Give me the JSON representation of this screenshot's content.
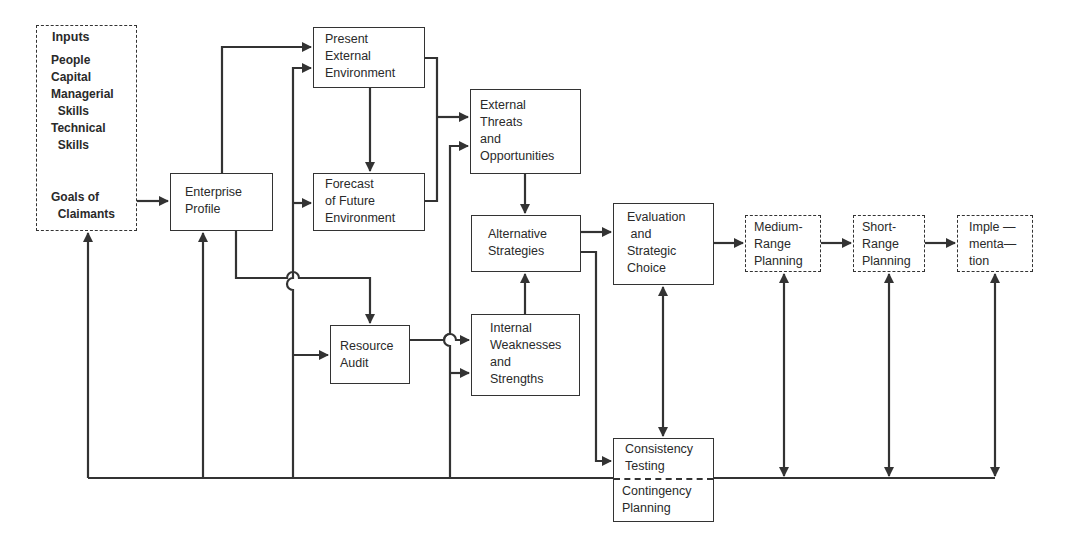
{
  "diagram": {
    "type": "flowchart",
    "nodes": {
      "inputs": {
        "heading": "Inputs",
        "items_text": "People\nCapital\nManagerial\n  Skills\nTechnical\n  Skills",
        "goals_text": "Goals of\n  Claimants",
        "style": "dashed"
      },
      "enterprise_profile": {
        "label": "Enterprise\nProfile",
        "style": "solid"
      },
      "present_external": {
        "label": "Present\nExternal\nEnvironment",
        "style": "solid"
      },
      "forecast_future": {
        "label": "Forecast\nof Future\nEnvironment",
        "style": "solid"
      },
      "resource_audit": {
        "label": "Resource\nAudit",
        "style": "solid"
      },
      "external_threats": {
        "label": "External\nThreats\nand\nOpportunities",
        "style": "solid"
      },
      "alternative_strategies": {
        "label": "Alternative\nStrategies",
        "style": "solid"
      },
      "internal_weaknesses": {
        "label": "Internal\nWeaknesses\nand\nStrengths",
        "style": "solid"
      },
      "evaluation": {
        "label": "Evaluation\n and\nStrategic\nChoice",
        "style": "solid"
      },
      "consistency": {
        "label_top": "Consistency\nTesting",
        "label_bottom": "Contingency\nPlanning",
        "style": "solid-with-dashed-divider"
      },
      "medium_range": {
        "label": "Medium-\nRange\nPlanning",
        "style": "dashed"
      },
      "short_range": {
        "label": "Short-\nRange\nPlanning",
        "style": "dashed"
      },
      "implementation": {
        "label": "Imple —\nmenta—\ntion",
        "style": "dashed"
      }
    },
    "edges": [
      {
        "from": "inputs",
        "to": "enterprise_profile"
      },
      {
        "from": "enterprise_profile",
        "to": "present_external"
      },
      {
        "from": "enterprise_profile",
        "to": "resource_audit"
      },
      {
        "from": "feedback_line",
        "to": "present_external"
      },
      {
        "from": "feedback_line",
        "to": "forecast_future"
      },
      {
        "from": "feedback_line",
        "to": "resource_audit"
      },
      {
        "from": "present_external",
        "to": "forecast_future"
      },
      {
        "from": "present_external",
        "to": "external_threats"
      },
      {
        "from": "forecast_future",
        "to": "external_threats"
      },
      {
        "from": "feedback_line",
        "to": "external_threats"
      },
      {
        "from": "resource_audit",
        "to": "internal_weaknesses"
      },
      {
        "from": "feedback_line",
        "to": "internal_weaknesses"
      },
      {
        "from": "external_threats",
        "to": "alternative_strategies"
      },
      {
        "from": "internal_weaknesses",
        "to": "alternative_strategies"
      },
      {
        "from": "alternative_strategies",
        "to": "evaluation"
      },
      {
        "from": "alternative_strategies",
        "to": "consistency"
      },
      {
        "from": "evaluation",
        "to": "consistency",
        "bidirectional": true
      },
      {
        "from": "evaluation",
        "to": "medium_range"
      },
      {
        "from": "medium_range",
        "to": "short_range"
      },
      {
        "from": "short_range",
        "to": "implementation"
      },
      {
        "from": "medium_range",
        "to": "feedback_line",
        "bidirectional": true
      },
      {
        "from": "short_range",
        "to": "feedback_line",
        "bidirectional": true
      },
      {
        "from": "implementation",
        "to": "feedback_line",
        "bidirectional": true
      },
      {
        "from": "feedback_line",
        "to": "inputs"
      },
      {
        "from": "feedback_line",
        "to": "enterprise_profile"
      }
    ],
    "colors": {
      "line": "#333333",
      "text": "#2a2a2a",
      "background": "#ffffff"
    }
  }
}
